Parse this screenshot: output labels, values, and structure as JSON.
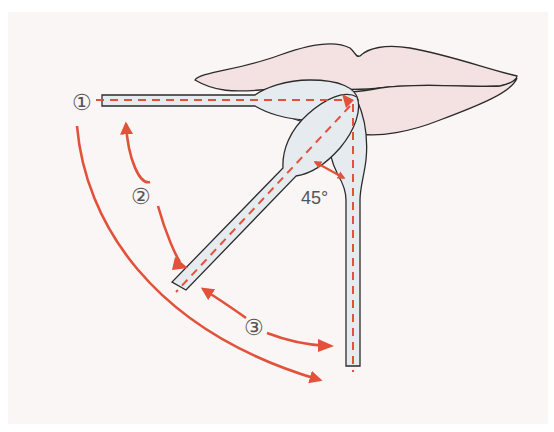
{
  "diagram": {
    "colors": {
      "background": "#fbf6f6",
      "lips_fill": "#f4e1e1",
      "swab_fill": "#e6ebef",
      "outline": "#2b2b2b",
      "arrow": "#e2513a",
      "label": "#555555"
    },
    "labels": {
      "position_1": "①",
      "position_2": "②",
      "position_3": "③",
      "angle": "45°"
    },
    "positions": [
      {
        "id": 1,
        "orientation": "horizontal",
        "angle_deg": 0
      },
      {
        "id": 2,
        "orientation": "diagonal",
        "angle_deg": 45
      },
      {
        "id": 3,
        "orientation": "vertical",
        "angle_deg": 90
      }
    ]
  }
}
